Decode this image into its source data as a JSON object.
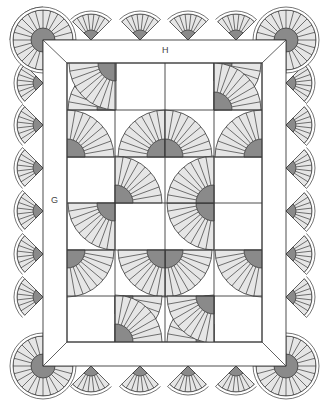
{
  "diagram": {
    "labels": {
      "top_border": "H",
      "side_border": "G"
    },
    "colors": {
      "line": "#3a3a3a",
      "fan_blade": "#e6e6e6",
      "fan_center": "#8a8a8a",
      "background": "#ffffff"
    },
    "outer_border": {
      "x": 43,
      "y": 40,
      "w": 243,
      "h": 326
    },
    "inner_field": {
      "x": 67,
      "y": 63,
      "w": 195,
      "h": 279
    },
    "grid": {
      "cols": [
        67,
        115,
        165,
        214,
        262
      ],
      "rows": [
        63,
        110,
        157,
        203,
        250,
        296,
        342
      ]
    },
    "scallop_count": {
      "top": 6,
      "bottom": 6,
      "left": 8,
      "right": 8
    }
  }
}
